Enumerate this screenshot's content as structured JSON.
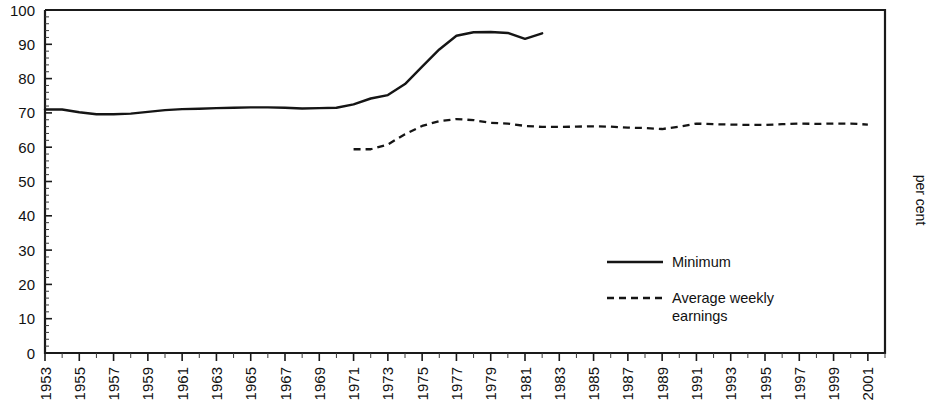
{
  "chart_data": {
    "type": "line",
    "title": "",
    "xlabel": "",
    "ylabel": "per cent",
    "ylim": [
      0,
      100
    ],
    "xlim": [
      1953,
      2002
    ],
    "grid": false,
    "legend_position": "inside-right",
    "y_ticks": [
      "0",
      "10",
      "20",
      "30",
      "40",
      "50",
      "60",
      "70",
      "80",
      "90",
      "100"
    ],
    "y_tick_values": [
      0,
      10,
      20,
      30,
      40,
      50,
      60,
      70,
      80,
      90,
      100
    ],
    "y_minor_tick_step": 2,
    "x_tick_labels": [
      "1953",
      "1955",
      "1957",
      "1959",
      "1961",
      "1963",
      "1965",
      "1967",
      "1969",
      "1971",
      "1973",
      "1975",
      "1977",
      "1979",
      "1981",
      "1983",
      "1985",
      "1987",
      "1989",
      "1991",
      "1993",
      "1995",
      "1997",
      "1999",
      "2001"
    ],
    "x_tick_label_rotation": -90,
    "series": [
      {
        "name": "Minimum",
        "style": "solid",
        "color": "#151515",
        "x": [
          1953,
          1954,
          1955,
          1956,
          1957,
          1958,
          1959,
          1960,
          1961,
          1962,
          1963,
          1964,
          1965,
          1966,
          1967,
          1968,
          1969,
          1970,
          1971,
          1972,
          1973,
          1974,
          1975,
          1976,
          1977,
          1978,
          1979,
          1980,
          1981,
          1982
        ],
        "values": [
          71.0,
          71.0,
          70.2,
          69.6,
          69.6,
          69.8,
          70.3,
          70.8,
          71.1,
          71.2,
          71.4,
          71.5,
          71.6,
          71.6,
          71.5,
          71.3,
          71.4,
          71.5,
          72.5,
          74.2,
          75.2,
          78.4,
          83.5,
          88.5,
          92.5,
          93.5,
          93.6,
          93.3,
          91.6,
          93.2
        ]
      },
      {
        "name": "Average weekly earnings",
        "style": "dashed",
        "color": "#151515",
        "x": [
          1971,
          1972,
          1973,
          1974,
          1975,
          1976,
          1977,
          1978,
          1979,
          1980,
          1981,
          1982,
          1983,
          1984,
          1985,
          1986,
          1987,
          1988,
          1989,
          1990,
          1991,
          1992,
          1993,
          1994,
          1995,
          1996,
          1997,
          1998,
          1999,
          2000,
          2001
        ],
        "values": [
          59.4,
          59.4,
          60.8,
          63.8,
          66.2,
          67.6,
          68.2,
          67.9,
          67.1,
          66.9,
          66.2,
          65.9,
          65.9,
          66.0,
          66.1,
          66.0,
          65.7,
          65.6,
          65.3,
          66.0,
          66.9,
          66.7,
          66.6,
          66.5,
          66.5,
          66.7,
          66.9,
          66.8,
          66.9,
          66.9,
          66.6
        ]
      }
    ]
  },
  "legend": {
    "entries": [
      {
        "label": "Minimum",
        "style": "solid"
      },
      {
        "label": "Average weekly",
        "label2": "earnings",
        "style": "dashed"
      }
    ]
  },
  "axis_titles": {
    "y_right": "per cent"
  }
}
